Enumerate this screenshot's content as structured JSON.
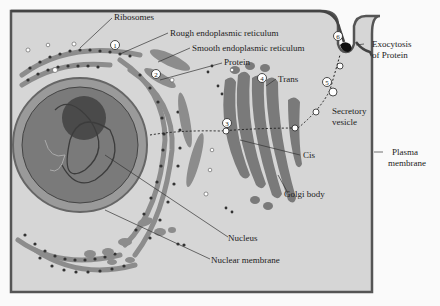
{
  "figure": {
    "labels": {
      "ribosomes": "Ribosomes",
      "rough_er": "Rough endoplasmic reticulum",
      "smooth_er": "Smooth endoplasmic reticulum",
      "protein": "Protein",
      "trans": "Trans",
      "exocytosis_line1": "Exocytosis",
      "exocytosis_line2": "of Protein",
      "secretory_line1": "Secretory",
      "secretory_line2": "vesicle",
      "cis": "Cis",
      "plasma_line1": "Plasma",
      "plasma_line2": "membrane",
      "golgi": "Golgi body",
      "nucleus": "Nucleus",
      "nuclear_membrane": "Nuclear membrane"
    },
    "steps": [
      "1",
      "2",
      "3",
      "4",
      "5",
      "6"
    ],
    "colors": {
      "cytoplasm": "#d6d6d6",
      "membrane": "#555555",
      "organelle": "#8c8c8c",
      "nucleus": "#7a7a7a",
      "nucleolus": "#4a4a4a",
      "ribosome": "#333333",
      "text": "#222222"
    }
  }
}
